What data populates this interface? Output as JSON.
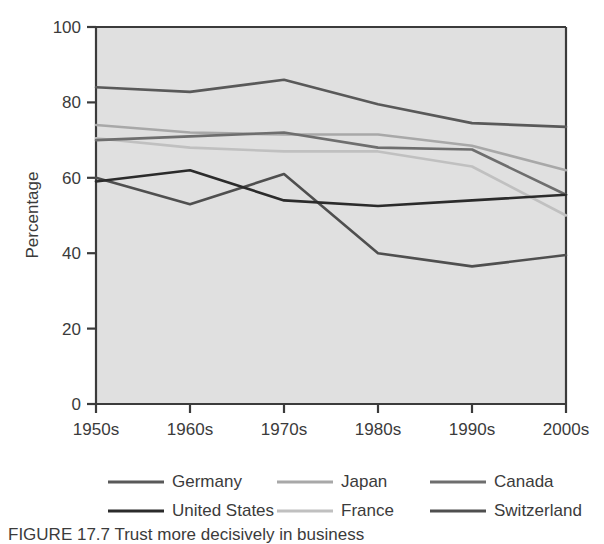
{
  "figure": {
    "caption": "FIGURE 17.7   Trust more decisively in business",
    "ylabel": "Percentage"
  },
  "chart_data": {
    "type": "line",
    "title": "",
    "xlabel": "",
    "ylabel": "Percentage",
    "categories": [
      "1950s",
      "1960s",
      "1970s",
      "1980s",
      "1990s",
      "2000s"
    ],
    "ylim": [
      0,
      100
    ],
    "yticks": [
      0,
      20,
      40,
      60,
      80,
      100
    ],
    "grid": false,
    "legend_position": "below",
    "plot_background": "#e0e0e0",
    "series": [
      {
        "name": "Germany",
        "color": "#595959",
        "values": [
          84.0,
          82.8,
          86.0,
          79.5,
          74.5,
          73.5
        ]
      },
      {
        "name": "Japan",
        "color": "#a8a8a8",
        "values": [
          74.0,
          72.0,
          71.5,
          71.5,
          68.5,
          62.0
        ]
      },
      {
        "name": "Canada",
        "color": "#6e6e6e",
        "values": [
          70.0,
          71.0,
          72.0,
          68.0,
          67.5,
          55.5
        ]
      },
      {
        "name": "United States",
        "color": "#2b2b2b",
        "values": [
          59.0,
          62.0,
          54.0,
          52.5,
          54.0,
          55.5
        ]
      },
      {
        "name": "France",
        "color": "#c0c0c0",
        "values": [
          70.5,
          68.0,
          67.0,
          67.0,
          63.0,
          50.0
        ]
      },
      {
        "name": "Switzerland",
        "color": "#4f4f4f",
        "values": [
          60.0,
          53.0,
          61.0,
          40.0,
          36.5,
          39.5
        ]
      }
    ]
  },
  "legend": {
    "items": [
      {
        "label": "Germany",
        "color": "#595959"
      },
      {
        "label": "Japan",
        "color": "#a8a8a8"
      },
      {
        "label": "Canada",
        "color": "#6e6e6e"
      },
      {
        "label": "United States",
        "color": "#2b2b2b"
      },
      {
        "label": "France",
        "color": "#c0c0c0"
      },
      {
        "label": "Switzerland",
        "color": "#4f4f4f"
      }
    ]
  }
}
